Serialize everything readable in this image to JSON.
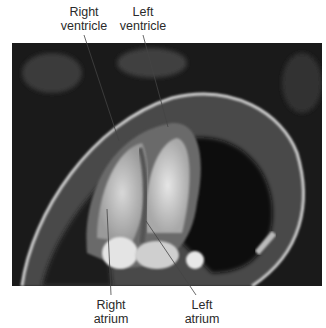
{
  "figure": {
    "image_alt": "Cardiac MRI four-chamber view",
    "labels": {
      "right_ventricle": [
        "Right",
        "ventricle"
      ],
      "left_ventricle": [
        "Left",
        "ventricle"
      ],
      "right_atrium": [
        "Right",
        "atrium"
      ],
      "left_atrium": [
        "Left",
        "atrium"
      ]
    }
  }
}
